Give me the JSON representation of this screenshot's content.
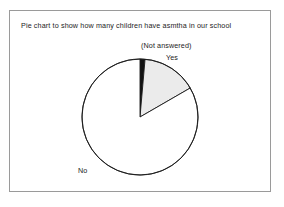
{
  "chart_data": {
    "type": "pie",
    "title": "Pie chart to show how many children have asmtha in our school",
    "categories": [
      "(Not answered)",
      "Yes",
      "No"
    ],
    "values": [
      1.4,
      15.3,
      83.3
    ],
    "units": "percent",
    "start_angle_deg": 0,
    "direction": "clockwise",
    "slices": [
      {
        "label": "(Not answered)",
        "value": 1.4,
        "start_angle_deg": 0,
        "end_angle_deg": 5,
        "fill": "#121212",
        "stroke": "#1a1a1a",
        "label_position": "outside-top"
      },
      {
        "label": "Yes",
        "value": 15.3,
        "start_angle_deg": 5,
        "end_angle_deg": 60,
        "fill": "#ebebeb",
        "stroke": "#1a1a1a",
        "label_position": "outside-upper-right"
      },
      {
        "label": "No",
        "value": 83.3,
        "start_angle_deg": 60,
        "end_angle_deg": 360,
        "fill": "#ffffff",
        "stroke": "#1a1a1a",
        "label_position": "outside-lower-left"
      }
    ],
    "legend": "none",
    "grid": false,
    "xlabel": "",
    "ylabel": "",
    "geometry": {
      "center_x": 140,
      "center_y": 117,
      "radius": 58
    }
  },
  "figure": {
    "title": "Pie chart to show how many children have asmtha in our school",
    "frame_color": "#9a9a9a",
    "background": "#ffffff",
    "labels": {
      "not_answered": "(Not answered)",
      "yes": "Yes",
      "no": "No"
    }
  }
}
